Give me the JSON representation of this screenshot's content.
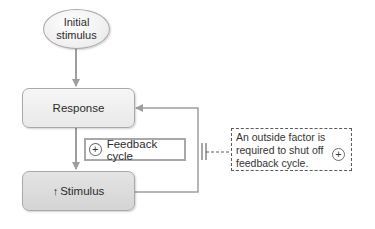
{
  "diagram": {
    "nodes": {
      "initial_stimulus": {
        "line1": "Initial",
        "line2": "stimulus"
      },
      "response": {
        "label": "Response"
      },
      "stimulus": {
        "arrow_icon": "↑",
        "label": "Stimulus"
      }
    },
    "feedback_label": {
      "icon": "+",
      "text": "Feedback cycle"
    },
    "note": {
      "lines": [
        "An outside factor is",
        "required to shut off",
        "feedback cycle."
      ],
      "icon": "+"
    },
    "colors": {
      "line": "#9e9e9e",
      "box_border": "#a9a9a9",
      "dashed": "#5a5a5a"
    }
  }
}
